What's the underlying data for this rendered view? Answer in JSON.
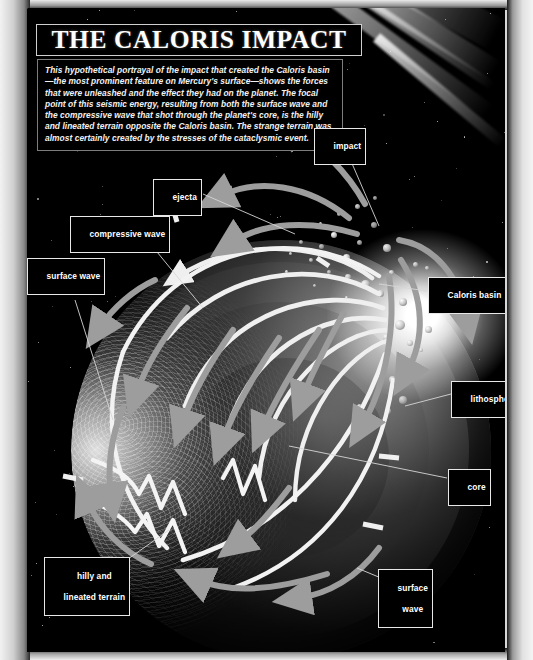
{
  "title": "THE CALORIS IMPACT",
  "caption": "This hypothetical portrayal of the impact that created the Caloris basin—the most prominent feature on Mercury's surface—shows the forces that were unleashed and the effect they had on the planet. The focal point of this seismic energy, resulting from both the surface wave and the compressive wave that shot through the planet's core, is the hilly and lineated terrain opposite the Caloris basin. The strange terrain was almost certainly created by the stresses of the cataclysmic event.",
  "labels": {
    "impact": "impact",
    "ejecta": "ejecta",
    "compressive_wave": "compressive wave",
    "surface_wave_left": "surface wave",
    "caloris_basin": "Caloris basin",
    "lithosphere": "lithosphere",
    "core": "core",
    "surface_wave_right_line1": "surface",
    "surface_wave_right_line2": "wave",
    "hilly_line1": "hilly and",
    "hilly_line2": "lineated terrain"
  },
  "colors": {
    "background": "#000000",
    "page_border": "#d8d8d8",
    "text": "#ffffff",
    "label_border": "#e8e8e8",
    "wave_arc": "#f0f0f0",
    "arrow_grey": "#9a9a9a",
    "flash": "#ffffff"
  },
  "figure": {
    "subject": "Mercury",
    "feature": "Caloris basin",
    "event": "cataclysmic meteor impact",
    "annotated_elements": [
      "incoming impactor streak",
      "impact flash",
      "ejecta debris",
      "compressive wave arcs through core",
      "surface wave arcs around crust",
      "lithosphere shell",
      "core",
      "hilly and lineated terrain antipode"
    ]
  }
}
